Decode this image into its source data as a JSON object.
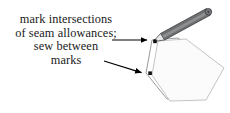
{
  "figure": {
    "background_color": "#ffffff",
    "caption": {
      "lines": [
        "mark intersections",
        "of seam allowances;",
        "sew between",
        "marks"
      ],
      "align": "center",
      "color": "#1a1a1a"
    },
    "shapes": {
      "outer_hexagon": {
        "name": "seam-allowance-outline",
        "stroke": "#8a8a8a",
        "fill": "#ffffff",
        "points": "152,40 178,38 221,66 205,97 167,99 146,73"
      },
      "inner_hexagon": {
        "name": "sewing-line-hexagon",
        "stroke": "#b3b3b3",
        "fill": "#fafafa",
        "points": "158,41 186,39 224,68 206,100 170,101 152,75"
      },
      "marks": [
        {
          "name": "intersection-mark-top",
          "x": 155,
          "y": 42,
          "size": 3.4,
          "color": "#111111"
        },
        {
          "name": "intersection-mark-left",
          "x": 150,
          "y": 73,
          "size": 3.4,
          "color": "#111111"
        }
      ],
      "arrows": [
        {
          "name": "arrow-to-top-mark",
          "from": [
            112,
            40
          ],
          "to": [
            152,
            40
          ],
          "color": "#000000"
        },
        {
          "name": "arrow-to-left-mark",
          "from": [
            104,
            61
          ],
          "to": [
            146,
            74
          ],
          "color": "#000000"
        }
      ],
      "pencil": {
        "name": "pencil",
        "body_color": "#6d6f71",
        "body_shade": "#8b8d8f",
        "outline": "#3c3e40",
        "tip_color": "#2b2b2b",
        "tip": [
          154,
          41
        ],
        "end": [
          210,
          12
        ]
      }
    }
  }
}
